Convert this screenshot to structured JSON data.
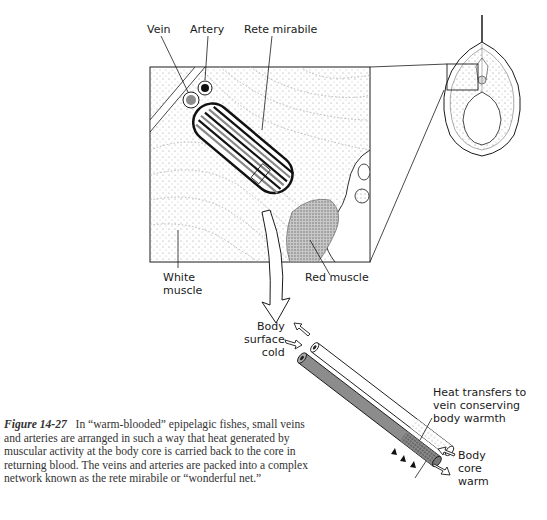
{
  "figure": {
    "number": "Figure 14-27",
    "caption": "In “warm-blooded” epipelagic fishes, small veins and arteries are arranged in such a way that heat generated by muscular activity at the body core is carried back to the core in returning blood. The veins and arteries are packed into a complex network known as the rete mirabile or “wonderful net.”"
  },
  "labels": {
    "vein": "Vein",
    "artery": "Artery",
    "rete_mirabile": "Rete mirabile",
    "white_muscle": "White\nmuscle",
    "red_muscle": "Red muscle",
    "body_surface_cold": "Body\nsurface\ncold",
    "heat_transfers": "Heat transfers to\nvein conserving\nbody warmth",
    "body_core_warm": "Body\ncore\nwarm"
  },
  "colors": {
    "ink": "#1a1a1a",
    "stipple": "#9a9a9a",
    "artery_fill": "#8c8c8c",
    "vein_fill": "#ffffff",
    "red_muscle": "#b0b0b0"
  }
}
